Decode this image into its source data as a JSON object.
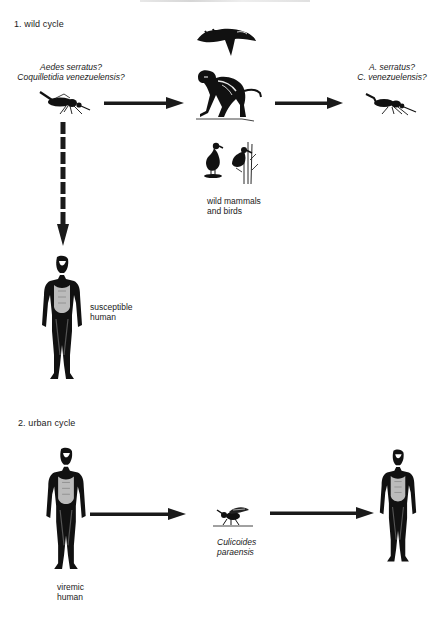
{
  "diagram": {
    "type": "transmission-cycle",
    "sections": [
      {
        "id": "wild",
        "label": "1.  wild cycle",
        "nodes": [
          {
            "id": "vector-left",
            "label_lines": [
              "Aedes serratus?",
              "Coquilletidia venezuelensis?"
            ],
            "icon": "mosquito-icon"
          },
          {
            "id": "hosts",
            "label_lines": [
              "wild mammals",
              "and birds"
            ],
            "icons": [
              "sloth-icon",
              "monkey-icon",
              "bird-icon",
              "heron-in-reeds-icon"
            ]
          },
          {
            "id": "vector-right",
            "label_lines": [
              "A.  serratus?",
              "C.  venezuelensis?"
            ],
            "icon": "mosquito-icon"
          },
          {
            "id": "human-susceptible",
            "label_lines": [
              "susceptible",
              "human"
            ],
            "icon": "human-figure-icon"
          }
        ],
        "edges": [
          {
            "from": "vector-left",
            "to": "hosts",
            "style": "solid"
          },
          {
            "from": "hosts",
            "to": "vector-right",
            "style": "solid"
          },
          {
            "from": "vector-left",
            "to": "human-susceptible",
            "style": "dashed"
          }
        ]
      },
      {
        "id": "urban",
        "label": "2.  urban cycle",
        "nodes": [
          {
            "id": "human-viremic",
            "label_lines": [
              "viremic",
              "human"
            ],
            "icon": "human-figure-icon"
          },
          {
            "id": "midge",
            "label_lines": [
              "Culicoides",
              "paraensis"
            ],
            "icon": "midge-icon"
          },
          {
            "id": "human-target",
            "label_lines": [],
            "icon": "human-figure-icon"
          }
        ],
        "edges": [
          {
            "from": "human-viremic",
            "to": "midge",
            "style": "solid"
          },
          {
            "from": "midge",
            "to": "human-target",
            "style": "solid"
          }
        ]
      }
    ]
  },
  "labels": {
    "wild_cycle": "1.  wild cycle",
    "urban_cycle": "2.  urban cycle",
    "vector_left_1": "Aedes serratus?",
    "vector_left_2": "Coquilletidia venezuelensis?",
    "vector_right_1": "A.  serratus?",
    "vector_right_2": "C.  venezuelensis?",
    "hosts_1": "wild mammals",
    "hosts_2": "and birds",
    "susceptible_1": "susceptible",
    "susceptible_2": "human",
    "viremic_1": "viremic",
    "viremic_2": "human",
    "midge_1": "Culicoides",
    "midge_2": "paraensis"
  },
  "colors": {
    "ink": "#1a1a1a",
    "background": "#ffffff"
  }
}
